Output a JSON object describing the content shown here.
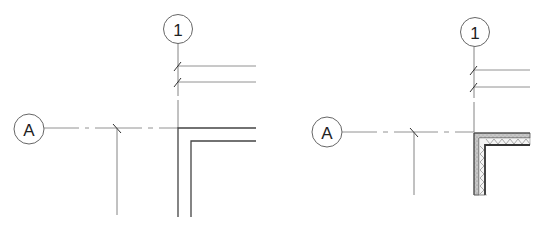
{
  "panels": [
    {
      "name": "left-detail",
      "grid_bubbles": {
        "vertical_grid": "1",
        "horizontal_grid": "A"
      },
      "wall_style": "plain-outline"
    },
    {
      "name": "right-detail",
      "grid_bubbles": {
        "vertical_grid": "1",
        "horizontal_grid": "A"
      },
      "wall_style": "hatched-layers"
    }
  ],
  "colors": {
    "line": "#555555",
    "wall": "#444444",
    "hatch_fill": "#bdbdbd",
    "background": "#ffffff"
  }
}
